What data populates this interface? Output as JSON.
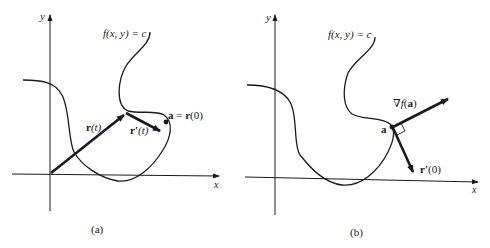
{
  "panels": [
    {
      "id": "a",
      "caption": "(a)",
      "axes": {
        "x_label": "x",
        "y_label": "y"
      },
      "curve_label": "f(x, y) = c",
      "vectors": [
        {
          "name": "r(t)",
          "label_main": "r",
          "label_arg": "(t)"
        },
        {
          "name": "r'(t)",
          "label_main": "r′",
          "label_arg": "(t)"
        }
      ],
      "point_label": {
        "lhs": "a",
        "eq": " = ",
        "rhs": "r",
        "rhs_arg": "(0)"
      }
    },
    {
      "id": "b",
      "caption": "(b)",
      "axes": {
        "x_label": "x",
        "y_label": "y"
      },
      "curve_label": "f(x, y) = c",
      "vectors": [
        {
          "name": "gradient",
          "label_nabla": "∇",
          "label_f": "f",
          "label_arg_open": "(",
          "label_arg": "a",
          "label_arg_close": ")"
        },
        {
          "name": "r'(0)",
          "label_main": "r′",
          "label_arg": "(0)"
        }
      ],
      "point_label": {
        "lhs": "a"
      },
      "perpendicular_marker": true
    }
  ],
  "colors": {
    "ink": "#1a1a1a",
    "background": "#ffffff"
  }
}
